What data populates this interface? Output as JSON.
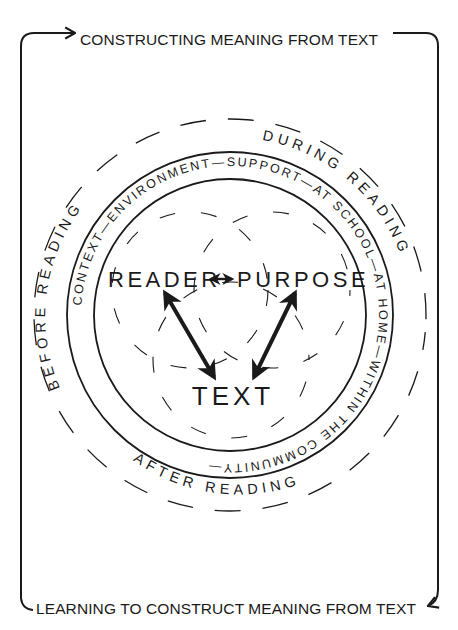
{
  "frame": {
    "top_label": "CONSTRUCTING MEANING FROM TEXT",
    "bottom_label": "LEARNING TO CONSTRUCT MEANING FROM TEXT",
    "ink_color": "#1a1a1a"
  },
  "ring": {
    "text": "CONTEXT—ENVIRONMENT—SUPPORT—AT SCHOOL—AT HOME—WITHIN THE COMMUNITY—"
  },
  "phases": {
    "before": "BEFORE READING",
    "during": "DURING READING",
    "after": "AFTER READING"
  },
  "core": {
    "reader": "READER",
    "purpose": "PURPOSE",
    "text": "TEXT",
    "reader_purpose_link": "↔"
  }
}
